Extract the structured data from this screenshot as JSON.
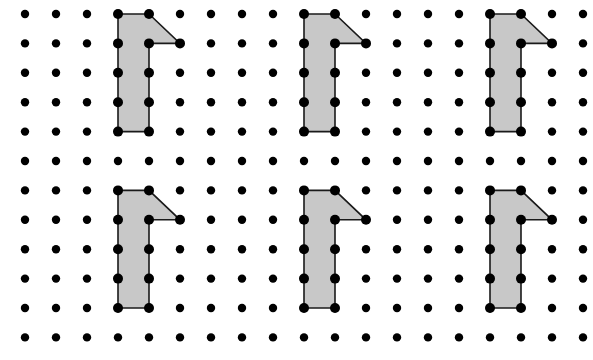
{
  "canvas": {
    "width": 593,
    "height": 360,
    "background": "#ffffff",
    "title": "Congruent L-shaped polygons on a dot lattice"
  },
  "grid": {
    "name": "dot-lattice",
    "origin_x": 25,
    "origin_y": 14,
    "spacing_x": 31,
    "spacing_y": 29.4,
    "columns": 19,
    "rows": 12,
    "dot_radius": 4.2,
    "dot_color": "#000000"
  },
  "style": {
    "fill_color": "#c8c8c8",
    "stroke_color": "#1a1a1a",
    "stroke_width": 1.6,
    "vertex_radius": 5.0,
    "vertex_color": "#000000"
  },
  "figures": [
    {
      "id": "figure-1",
      "label": "top-left-polygon",
      "row": "top",
      "col_index": 0,
      "origin_col": 3,
      "origin_row": 0,
      "vertices_grid": [
        [
          0,
          0
        ],
        [
          1,
          0
        ],
        [
          2,
          1
        ],
        [
          1,
          1
        ],
        [
          1,
          4
        ],
        [
          0,
          4
        ]
      ],
      "vertex_count": 6,
      "marked_lattice_points": [
        [
          0,
          0
        ],
        [
          1,
          0
        ],
        [
          2,
          1
        ],
        [
          1,
          1
        ],
        [
          0,
          1
        ],
        [
          0,
          2
        ],
        [
          1,
          2
        ],
        [
          0,
          3
        ],
        [
          1,
          3
        ],
        [
          0,
          4
        ],
        [
          1,
          4
        ]
      ]
    },
    {
      "id": "figure-2",
      "label": "top-middle-polygon",
      "row": "top",
      "col_index": 1,
      "origin_col": 9,
      "origin_row": 0,
      "vertices_grid": [
        [
          0,
          0
        ],
        [
          1,
          0
        ],
        [
          2,
          1
        ],
        [
          1,
          1
        ],
        [
          1,
          4
        ],
        [
          0,
          4
        ]
      ],
      "vertex_count": 6,
      "marked_lattice_points": [
        [
          0,
          0
        ],
        [
          1,
          0
        ],
        [
          2,
          1
        ],
        [
          1,
          1
        ],
        [
          0,
          1
        ],
        [
          0,
          2
        ],
        [
          1,
          2
        ],
        [
          0,
          3
        ],
        [
          1,
          3
        ],
        [
          0,
          4
        ],
        [
          1,
          4
        ]
      ]
    },
    {
      "id": "figure-3",
      "label": "top-right-polygon",
      "row": "top",
      "col_index": 2,
      "origin_col": 15,
      "origin_row": 0,
      "vertices_grid": [
        [
          0,
          0
        ],
        [
          1,
          0
        ],
        [
          2,
          1
        ],
        [
          1,
          1
        ],
        [
          1,
          4
        ],
        [
          0,
          4
        ]
      ],
      "vertex_count": 6,
      "marked_lattice_points": [
        [
          0,
          0
        ],
        [
          1,
          0
        ],
        [
          2,
          1
        ],
        [
          1,
          1
        ],
        [
          0,
          1
        ],
        [
          0,
          2
        ],
        [
          1,
          2
        ],
        [
          0,
          3
        ],
        [
          1,
          3
        ],
        [
          0,
          4
        ],
        [
          1,
          4
        ]
      ]
    },
    {
      "id": "figure-4",
      "label": "bottom-left-polygon",
      "row": "bottom",
      "col_index": 0,
      "origin_col": 3,
      "origin_row": 6,
      "vertices_grid": [
        [
          0,
          0
        ],
        [
          1,
          0
        ],
        [
          2,
          1
        ],
        [
          1,
          1
        ],
        [
          1,
          4
        ],
        [
          0,
          4
        ]
      ],
      "vertex_count": 6,
      "marked_lattice_points": [
        [
          0,
          0
        ],
        [
          1,
          0
        ],
        [
          2,
          1
        ],
        [
          1,
          1
        ],
        [
          0,
          1
        ],
        [
          0,
          2
        ],
        [
          1,
          2
        ],
        [
          0,
          3
        ],
        [
          1,
          3
        ],
        [
          0,
          4
        ],
        [
          1,
          4
        ]
      ]
    },
    {
      "id": "figure-5",
      "label": "bottom-middle-polygon",
      "row": "bottom",
      "col_index": 1,
      "origin_col": 9,
      "origin_row": 6,
      "vertices_grid": [
        [
          0,
          0
        ],
        [
          1,
          0
        ],
        [
          2,
          1
        ],
        [
          1,
          1
        ],
        [
          1,
          4
        ],
        [
          0,
          4
        ]
      ],
      "vertex_count": 6,
      "marked_lattice_points": [
        [
          0,
          0
        ],
        [
          1,
          0
        ],
        [
          2,
          1
        ],
        [
          1,
          1
        ],
        [
          0,
          1
        ],
        [
          0,
          2
        ],
        [
          1,
          2
        ],
        [
          0,
          3
        ],
        [
          1,
          3
        ],
        [
          0,
          4
        ],
        [
          1,
          4
        ]
      ]
    },
    {
      "id": "figure-6",
      "label": "bottom-right-polygon",
      "row": "bottom",
      "col_index": 2,
      "origin_col": 15,
      "origin_row": 6,
      "vertices_grid": [
        [
          0,
          0
        ],
        [
          1,
          0
        ],
        [
          2,
          1
        ],
        [
          1,
          1
        ],
        [
          1,
          4
        ],
        [
          0,
          4
        ]
      ],
      "vertex_count": 6,
      "marked_lattice_points": [
        [
          0,
          0
        ],
        [
          1,
          0
        ],
        [
          2,
          1
        ],
        [
          1,
          1
        ],
        [
          0,
          1
        ],
        [
          0,
          2
        ],
        [
          1,
          2
        ],
        [
          0,
          3
        ],
        [
          1,
          3
        ],
        [
          0,
          4
        ],
        [
          1,
          4
        ]
      ]
    }
  ]
}
